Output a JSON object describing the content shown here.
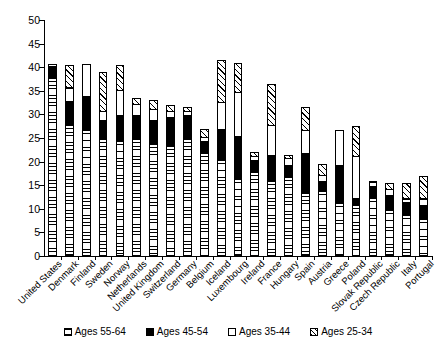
{
  "chart_data": {
    "type": "bar",
    "subtype": "stacked-column",
    "title": "",
    "xlabel": "",
    "ylabel": "",
    "ylim": [
      0,
      50
    ],
    "yticks": [
      0,
      5,
      10,
      15,
      20,
      25,
      30,
      35,
      40,
      45,
      50
    ],
    "grid": false,
    "legend_position": "bottom",
    "categories": [
      "United States",
      "Denmark",
      "Finland",
      "Sweden",
      "Norway",
      "Netherlands",
      "United Kingdom",
      "Switzerland",
      "Germany",
      "Belgium",
      "Iceland",
      "Luxembourg",
      "Ireland",
      "France",
      "Hungary",
      "Spain",
      "Austria",
      "Greece",
      "Poland",
      "Slovak Republic",
      "Czech Republic",
      "Italy",
      "Portugal"
    ],
    "series": [
      {
        "name": "Ages 55-64",
        "color": "#ffffff",
        "pattern": "horizontal-lines",
        "values": [
          38.0,
          28.0,
          27.0,
          25.0,
          24.5,
          25.0,
          24.0,
          23.5,
          25.0,
          22.0,
          20.5,
          16.5,
          18.0,
          16.0,
          17.0,
          13.5,
          14.0,
          11.5,
          11.0,
          12.5,
          10.0,
          9.0,
          8.0
        ]
      },
      {
        "name": "Ages 45-54",
        "color": "#000000",
        "pattern": "solid",
        "values": [
          2.3,
          5.0,
          7.0,
          4.0,
          5.5,
          5.0,
          5.0,
          6.0,
          5.0,
          2.5,
          6.5,
          9.0,
          2.5,
          5.5,
          2.5,
          8.5,
          2.0,
          8.0,
          1.5,
          2.5,
          3.0,
          2.5,
          3.0
        ]
      },
      {
        "name": "Ages 35-44",
        "color": "#ffffff",
        "pattern": "none",
        "values": [
          0.7,
          3.0,
          7.0,
          2.0,
          5.5,
          2.5,
          2.5,
          1.5,
          1.0,
          1.0,
          6.0,
          9.5,
          1.0,
          6.5,
          1.5,
          5.0,
          1.5,
          7.5,
          9.0,
          1.0,
          1.5,
          1.0,
          1.5
        ]
      },
      {
        "name": "Ages 25-34",
        "color": "#ffffff",
        "pattern": "diagonal-hatch",
        "values": [
          0.0,
          5.0,
          0.0,
          8.5,
          5.5,
          1.5,
          2.0,
          1.5,
          1.0,
          2.0,
          9.0,
          6.5,
          1.0,
          9.0,
          1.0,
          5.0,
          2.5,
          0.0,
          6.5,
          0.5,
          1.5,
          3.5,
          5.0
        ]
      }
    ],
    "totals": [
      41.0,
      41.0,
      41.0,
      39.5,
      41.0,
      34.0,
      33.5,
      32.5,
      32.0,
      27.5,
      42.0,
      41.5,
      22.5,
      37.0,
      22.0,
      32.0,
      20.0,
      27.0,
      28.0,
      16.5,
      16.0,
      16.0,
      17.5
    ]
  },
  "legend": {
    "items": [
      {
        "label": "Ages 55-64",
        "key": "s5564"
      },
      {
        "label": "Ages 45-54",
        "key": "s4554"
      },
      {
        "label": "Ages 35-44",
        "key": "s3544"
      },
      {
        "label": "Ages 25-34",
        "key": "s2534"
      }
    ]
  }
}
